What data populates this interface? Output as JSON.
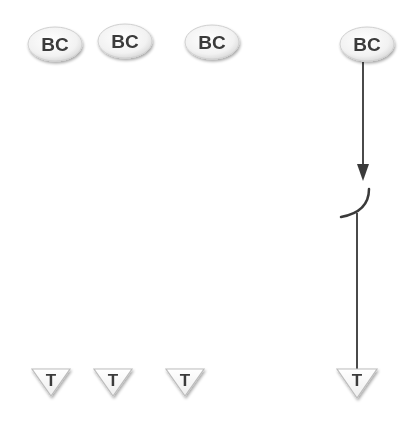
{
  "diagram": {
    "colors": {
      "background": "#ffffff",
      "node_fill": "#f4f4f4",
      "node_stroke": "#cfcfcf",
      "label": "#3a3a3a",
      "line": "#4a4a4a"
    },
    "bc_nodes": [
      {
        "label": "BC",
        "cx": 55,
        "cy": 44
      },
      {
        "label": "BC",
        "cx": 125,
        "cy": 41
      },
      {
        "label": "BC",
        "cx": 212,
        "cy": 42
      },
      {
        "label": "BC",
        "cx": 367,
        "cy": 44
      }
    ],
    "t_nodes": [
      {
        "label": "T",
        "cx": 50,
        "cy": 380
      },
      {
        "label": "T",
        "cx": 113,
        "cy": 380
      },
      {
        "label": "T",
        "cx": 185,
        "cy": 380
      },
      {
        "label": "T",
        "cx": 357,
        "cy": 378
      }
    ],
    "connection": {
      "from": "BC 4",
      "to": "T 4",
      "arrow": "down",
      "switch": "open-arc"
    }
  }
}
